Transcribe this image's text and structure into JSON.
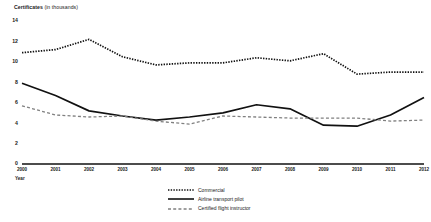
{
  "chart_data": {
    "type": "line",
    "title": "Certificates",
    "title_unit": "(in thousands)",
    "xlabel": "Year",
    "ylabel": "Certificates (in thousands)",
    "ylim": [
      0,
      14
    ],
    "yticks": [
      14,
      12,
      10,
      8,
      6,
      4,
      2,
      0
    ],
    "grid": false,
    "legend_position": "bottom-center",
    "categories": [
      "2000",
      "2001",
      "2002",
      "2003",
      "2004",
      "2005",
      "2006",
      "2007",
      "2008",
      "2009",
      "2010",
      "2011",
      "2012"
    ],
    "x": [
      2000,
      2001,
      2002,
      2003,
      2004,
      2005,
      2006,
      2007,
      2008,
      2009,
      2010,
      2011,
      2012
    ],
    "series": [
      {
        "name": "Commercial",
        "style": "dotted",
        "color": "#111111",
        "values": [
          10.9,
          11.2,
          12.2,
          10.5,
          9.7,
          9.9,
          9.9,
          10.4,
          10.1,
          10.8,
          8.8,
          9.0,
          9.0
        ]
      },
      {
        "name": "Airline transport pilot",
        "style": "solid",
        "color": "#111111",
        "values": [
          7.9,
          6.7,
          5.2,
          4.7,
          4.3,
          4.6,
          5.0,
          5.8,
          5.4,
          3.8,
          3.7,
          4.8,
          6.5
        ]
      },
      {
        "name": "Certified flight instructor",
        "style": "dashed",
        "color": "#808080",
        "values": [
          5.7,
          4.8,
          4.6,
          4.7,
          4.2,
          3.9,
          4.7,
          4.6,
          4.5,
          4.5,
          4.5,
          4.2,
          4.3
        ]
      }
    ]
  },
  "legend": {
    "items": [
      {
        "label": "Commercial"
      },
      {
        "label": "Airline transport pilot"
      },
      {
        "label": "Certified flight instructor"
      }
    ]
  },
  "axes": {
    "y_title_main": "Certificates",
    "y_title_unit": "(in thousands)",
    "x_title": "Year"
  }
}
